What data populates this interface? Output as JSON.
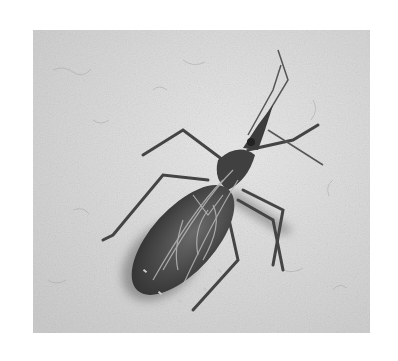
{
  "image": {
    "subject": "kissing bug (triatomine insect) on textured wall",
    "colors": {
      "background": "#ffffff",
      "wall": "#d6d6d6",
      "wall_light": "#e6e6e6",
      "body_dark": "#3a3a3a",
      "body_mid": "#5a5a5a",
      "stripe": "#b8b8b8",
      "shadow": "#8a8a8a",
      "leg": "#4a4a4a"
    }
  }
}
